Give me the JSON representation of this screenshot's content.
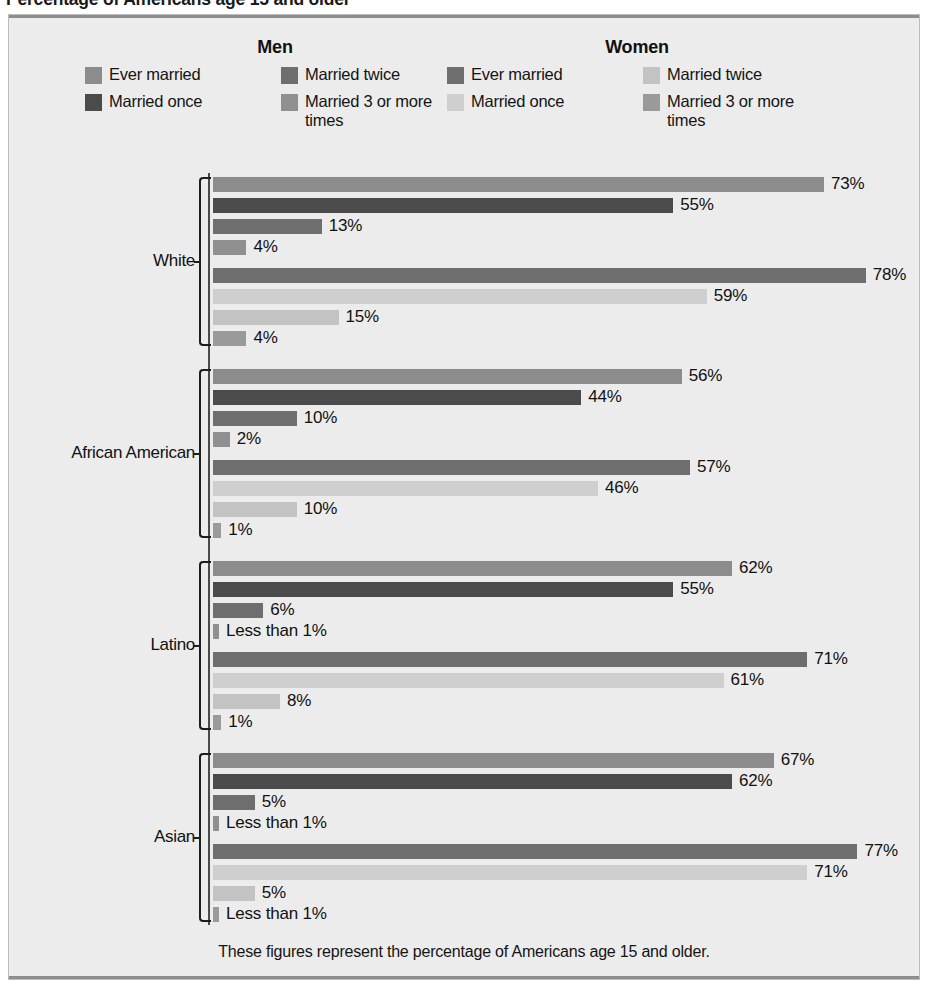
{
  "page": {
    "title": "Percentage of Americans age 15 and older"
  },
  "legend": {
    "men": {
      "heading": "Men",
      "entries": [
        {
          "label": "Ever married",
          "color": "#8c8c8c",
          "icon": "legend-swatch"
        },
        {
          "label": "Married twice",
          "color": "#6e6e6e",
          "icon": "legend-swatch"
        },
        {
          "label": "Married once",
          "color": "#4b4b4b",
          "icon": "legend-swatch"
        },
        {
          "label": "Married 3 or more times",
          "color": "#909090",
          "icon": "legend-swatch"
        }
      ]
    },
    "women": {
      "heading": "Women",
      "entries": [
        {
          "label": "Ever married",
          "color": "#6e6e6e",
          "icon": "legend-swatch"
        },
        {
          "label": "Married twice",
          "color": "#c3c3c3",
          "icon": "legend-swatch"
        },
        {
          "label": "Married once",
          "color": "#cfcfcf",
          "icon": "legend-swatch"
        },
        {
          "label": "Married 3 or more times",
          "color": "#9a9a9a",
          "icon": "legend-swatch"
        }
      ]
    }
  },
  "footer": {
    "note": "These figures represent the percentage of Americans age 15 and older."
  },
  "colors": {
    "panel_background": "#ececec",
    "panel_border": "#bdbdbd",
    "panel_rule": "#8d8d8d",
    "axis": "#4a4a4a",
    "men_ever_married": "#8c8c8c",
    "men_married_once": "#4b4b4b",
    "men_married_twice": "#6e6e6e",
    "men_married_3_plus": "#909090",
    "women_ever_married": "#6e6e6e",
    "women_married_once": "#cfcfcf",
    "women_married_twice": "#c3c3c3",
    "women_married_3_plus": "#9a9a9a"
  },
  "chart_data": {
    "type": "bar",
    "orientation": "horizontal",
    "title": "Percentage of Americans age 15 and older",
    "subtitle": "These figures represent the percentage of Americans age 15 and older.",
    "xlabel": "",
    "ylabel": "",
    "xlim": [
      0,
      80
    ],
    "grid": false,
    "legend_position": "top",
    "categories": [
      "White",
      "African American",
      "Latino",
      "Asian"
    ],
    "series": [
      {
        "name": "Men — Ever married",
        "sex": "Men",
        "color": "#8c8c8c",
        "values": [
          73,
          56,
          62,
          67
        ],
        "labels": [
          "73%",
          "56%",
          "62%",
          "67%"
        ]
      },
      {
        "name": "Men — Married once",
        "sex": "Men",
        "color": "#4b4b4b",
        "values": [
          55,
          44,
          55,
          62
        ],
        "labels": [
          "55%",
          "44%",
          "55%",
          "62%"
        ]
      },
      {
        "name": "Men — Married twice",
        "sex": "Men",
        "color": "#6e6e6e",
        "values": [
          13,
          10,
          6,
          5
        ],
        "labels": [
          "13%",
          "10%",
          "6%",
          "5%"
        ]
      },
      {
        "name": "Men — Married 3 or more times",
        "sex": "Men",
        "color": "#909090",
        "values": [
          4,
          2,
          0.5,
          0.5
        ],
        "labels": [
          "4%",
          "2%",
          "Less than 1%",
          "Less than 1%"
        ]
      },
      {
        "name": "Women — Ever married",
        "sex": "Women",
        "color": "#6e6e6e",
        "values": [
          78,
          57,
          71,
          77
        ],
        "labels": [
          "78%",
          "57%",
          "71%",
          "77%"
        ]
      },
      {
        "name": "Women — Married once",
        "sex": "Women",
        "color": "#cfcfcf",
        "values": [
          59,
          46,
          61,
          71
        ],
        "labels": [
          "59%",
          "46%",
          "61%",
          "71%"
        ]
      },
      {
        "name": "Women — Married twice",
        "sex": "Women",
        "color": "#c3c3c3",
        "values": [
          15,
          10,
          8,
          5
        ],
        "labels": [
          "15%",
          "10%",
          "8%",
          "5%"
        ]
      },
      {
        "name": "Women — Married 3 or more times",
        "sex": "Women",
        "color": "#9a9a9a",
        "values": [
          4,
          1,
          1,
          0.5
        ],
        "labels": [
          "4%",
          "1%",
          "1%",
          "Less than 1%"
        ]
      }
    ],
    "groups": [
      {
        "label": "White",
        "bars": [
          {
            "series": "Men — Ever married",
            "value": 73,
            "label": "73%",
            "color": "#8c8c8c"
          },
          {
            "series": "Men — Married once",
            "value": 55,
            "label": "55%",
            "color": "#4b4b4b"
          },
          {
            "series": "Men — Married twice",
            "value": 13,
            "label": "13%",
            "color": "#6e6e6e"
          },
          {
            "series": "Men — Married 3 or more times",
            "value": 4,
            "label": "4%",
            "color": "#909090"
          },
          {
            "series": "Women — Ever married",
            "value": 78,
            "label": "78%",
            "color": "#6e6e6e"
          },
          {
            "series": "Women — Married once",
            "value": 59,
            "label": "59%",
            "color": "#cfcfcf"
          },
          {
            "series": "Women — Married twice",
            "value": 15,
            "label": "15%",
            "color": "#c3c3c3"
          },
          {
            "series": "Women — Married 3 or more times",
            "value": 4,
            "label": "4%",
            "color": "#9a9a9a"
          }
        ]
      },
      {
        "label": "African American",
        "bars": [
          {
            "series": "Men — Ever married",
            "value": 56,
            "label": "56%",
            "color": "#8c8c8c"
          },
          {
            "series": "Men — Married once",
            "value": 44,
            "label": "44%",
            "color": "#4b4b4b"
          },
          {
            "series": "Men — Married twice",
            "value": 10,
            "label": "10%",
            "color": "#6e6e6e"
          },
          {
            "series": "Men — Married 3 or more times",
            "value": 2,
            "label": "2%",
            "color": "#909090"
          },
          {
            "series": "Women — Ever married",
            "value": 57,
            "label": "57%",
            "color": "#6e6e6e"
          },
          {
            "series": "Women — Married once",
            "value": 46,
            "label": "46%",
            "color": "#cfcfcf"
          },
          {
            "series": "Women — Married twice",
            "value": 10,
            "label": "10%",
            "color": "#c3c3c3"
          },
          {
            "series": "Women — Married 3 or more times",
            "value": 1,
            "label": "1%",
            "color": "#9a9a9a"
          }
        ]
      },
      {
        "label": "Latino",
        "bars": [
          {
            "series": "Men — Ever married",
            "value": 62,
            "label": "62%",
            "color": "#8c8c8c"
          },
          {
            "series": "Men — Married once",
            "value": 55,
            "label": "55%",
            "color": "#4b4b4b"
          },
          {
            "series": "Men — Married twice",
            "value": 6,
            "label": "6%",
            "color": "#6e6e6e"
          },
          {
            "series": "Men — Married 3 or more times",
            "value": 0.5,
            "label": "Less than 1%",
            "color": "#909090"
          },
          {
            "series": "Women — Ever married",
            "value": 71,
            "label": "71%",
            "color": "#6e6e6e"
          },
          {
            "series": "Women — Married once",
            "value": 61,
            "label": "61%",
            "color": "#cfcfcf"
          },
          {
            "series": "Women — Married twice",
            "value": 8,
            "label": "8%",
            "color": "#c3c3c3"
          },
          {
            "series": "Women — Married 3 or more times",
            "value": 1,
            "label": "1%",
            "color": "#9a9a9a"
          }
        ]
      },
      {
        "label": "Asian",
        "bars": [
          {
            "series": "Men — Ever married",
            "value": 67,
            "label": "67%",
            "color": "#8c8c8c"
          },
          {
            "series": "Men — Married once",
            "value": 62,
            "label": "62%",
            "color": "#4b4b4b"
          },
          {
            "series": "Men — Married twice",
            "value": 5,
            "label": "5%",
            "color": "#6e6e6e"
          },
          {
            "series": "Men — Married 3 or more times",
            "value": 0.5,
            "label": "Less than 1%",
            "color": "#909090"
          },
          {
            "series": "Women — Ever married",
            "value": 77,
            "label": "77%",
            "color": "#6e6e6e"
          },
          {
            "series": "Women — Married once",
            "value": 71,
            "label": "71%",
            "color": "#cfcfcf"
          },
          {
            "series": "Women — Married twice",
            "value": 5,
            "label": "5%",
            "color": "#c3c3c3"
          },
          {
            "series": "Women — Married 3 or more times",
            "value": 0.5,
            "label": "Less than 1%",
            "color": "#9a9a9a"
          }
        ]
      }
    ]
  }
}
